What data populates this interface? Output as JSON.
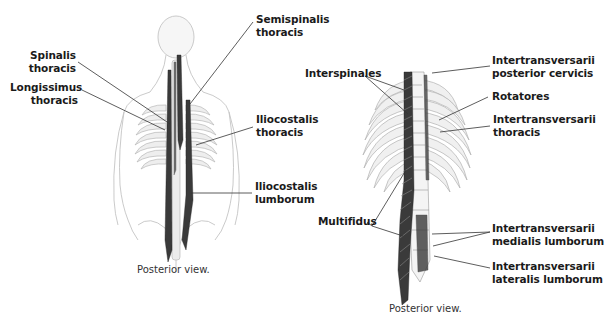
{
  "figures": [
    {
      "id": "left",
      "caption": "Posterior view.",
      "labels": {
        "spinalis": [
          "Spinalis",
          "thoracis"
        ],
        "longissimus": [
          "Longissimus",
          "thoracis"
        ],
        "semispinalis": [
          "Semispinalis",
          "thoracis"
        ],
        "iliocostalis_thoracis": [
          "Iliocostalis",
          "thoracis"
        ],
        "iliocostalis_lumborum": [
          "Iliocostalis",
          "lumborum"
        ]
      }
    },
    {
      "id": "right",
      "caption": "Posterior view.",
      "labels": {
        "interspinales": [
          "Interspinales"
        ],
        "intertrans_post_cerv": [
          "Intertransversarii",
          "posterior cervicis"
        ],
        "rotatores": [
          "Rotatores"
        ],
        "intertrans_thoracis": [
          "Intertransversarii",
          "thoracis"
        ],
        "multifidus": [
          "Multifidus"
        ],
        "intertrans_medialis": [
          "Intertransversarii",
          "medialis lumborum"
        ],
        "intertrans_lateralis": [
          "Intertransversarii",
          "lateralis lumborum"
        ]
      }
    }
  ],
  "colors": {
    "muscle": "#3a3a3a",
    "outline": "#b5b5b5",
    "bone": "#e8e8e8",
    "leader": "#333333",
    "text": "#1a1a1a"
  }
}
